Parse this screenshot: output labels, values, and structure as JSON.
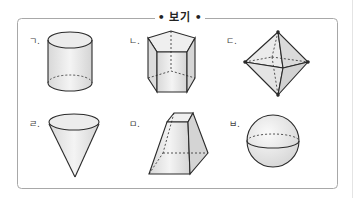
{
  "box": {
    "title": "• 보기 •",
    "border_color": "#9a9a9a"
  },
  "shapes": [
    {
      "label": "ㄱ.",
      "name": "cylinder"
    },
    {
      "label": "ㄴ.",
      "name": "pentagonal-prism"
    },
    {
      "label": "ㄷ.",
      "name": "octahedron"
    },
    {
      "label": "ㄹ.",
      "name": "cone"
    },
    {
      "label": "ㅁ.",
      "name": "square-frustum"
    },
    {
      "label": "ㅂ.",
      "name": "sphere"
    }
  ],
  "colors": {
    "stroke": "#2a2a2a",
    "fill": "#e6e6e6",
    "fill_light": "#f2f2f2"
  }
}
